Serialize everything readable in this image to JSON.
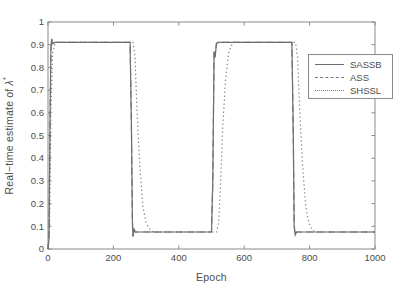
{
  "figure": {
    "xlabel": "Epoch",
    "ylabel_parts": {
      "prefix": "Real−time estimate of ",
      "symbol": "λ",
      "sup": "*"
    }
  },
  "colors": {
    "background": "#ffffff",
    "axis": "#8a8a8a",
    "tick_text": "#4d4d4d",
    "label_text": "#4d4d4d",
    "legend_border": "#8a8a8a"
  },
  "chart_data": {
    "type": "line",
    "title": "",
    "xlabel": "Epoch",
    "ylabel": "Real−time estimate of λ*",
    "xlim": [
      0,
      1000
    ],
    "ylim": [
      0,
      1
    ],
    "xticks": [
      "0",
      "200",
      "400",
      "600",
      "800",
      "1000"
    ],
    "yticks": [
      "0",
      "0.1",
      "0.2",
      "0.3",
      "0.4",
      "0.5",
      "0.6",
      "0.7",
      "0.8",
      "0.9",
      "1"
    ],
    "grid": false,
    "box": true,
    "legend_position": "upper right",
    "series": [
      {
        "name": "SASSB",
        "style": "solid",
        "color": "#6e6e6e",
        "points": [
          [
            0,
            0
          ],
          [
            3,
            0.05
          ],
          [
            6,
            0.55
          ],
          [
            9,
            0.875
          ],
          [
            11,
            0.925
          ],
          [
            14,
            0.905
          ],
          [
            20,
            0.91
          ],
          [
            251,
            0.91
          ],
          [
            255,
            0.55
          ],
          [
            258,
            0.12
          ],
          [
            260,
            0.055
          ],
          [
            263,
            0.09
          ],
          [
            266,
            0.075
          ],
          [
            500,
            0.075
          ],
          [
            504,
            0.3
          ],
          [
            508,
            0.87
          ],
          [
            511,
            0.845
          ],
          [
            515,
            0.905
          ],
          [
            520,
            0.91
          ],
          [
            746,
            0.91
          ],
          [
            750,
            0.5
          ],
          [
            753,
            0.1
          ],
          [
            756,
            0.062
          ],
          [
            760,
            0.075
          ],
          [
            1000,
            0.075
          ]
        ]
      },
      {
        "name": "ASS",
        "style": "dashed",
        "color": "#7a7a7a",
        "points": [
          [
            0,
            0
          ],
          [
            3,
            0.05
          ],
          [
            6,
            0.55
          ],
          [
            9,
            0.875
          ],
          [
            11,
            0.925
          ],
          [
            14,
            0.905
          ],
          [
            20,
            0.91
          ],
          [
            251,
            0.91
          ],
          [
            255,
            0.55
          ],
          [
            258,
            0.12
          ],
          [
            260,
            0.055
          ],
          [
            263,
            0.09
          ],
          [
            266,
            0.075
          ],
          [
            500,
            0.075
          ],
          [
            504,
            0.3
          ],
          [
            508,
            0.87
          ],
          [
            511,
            0.845
          ],
          [
            515,
            0.905
          ],
          [
            520,
            0.91
          ],
          [
            746,
            0.91
          ],
          [
            750,
            0.5
          ],
          [
            753,
            0.1
          ],
          [
            756,
            0.062
          ],
          [
            760,
            0.075
          ],
          [
            1000,
            0.075
          ]
        ]
      },
      {
        "name": "SHSSL",
        "style": "dotted",
        "color": "#7f7f7f",
        "points": [
          [
            0,
            0
          ],
          [
            5,
            0.1
          ],
          [
            9,
            0.6
          ],
          [
            14,
            0.86
          ],
          [
            20,
            0.9
          ],
          [
            24,
            0.91
          ],
          [
            260,
            0.91
          ],
          [
            266,
            0.85
          ],
          [
            272,
            0.62
          ],
          [
            280,
            0.38
          ],
          [
            290,
            0.19
          ],
          [
            300,
            0.115
          ],
          [
            310,
            0.09
          ],
          [
            320,
            0.078
          ],
          [
            330,
            0.075
          ],
          [
            516,
            0.075
          ],
          [
            522,
            0.12
          ],
          [
            528,
            0.3
          ],
          [
            535,
            0.55
          ],
          [
            543,
            0.75
          ],
          [
            552,
            0.86
          ],
          [
            560,
            0.895
          ],
          [
            568,
            0.91
          ],
          [
            757,
            0.91
          ],
          [
            763,
            0.85
          ],
          [
            770,
            0.6
          ],
          [
            778,
            0.38
          ],
          [
            788,
            0.19
          ],
          [
            798,
            0.115
          ],
          [
            808,
            0.085
          ],
          [
            818,
            0.075
          ],
          [
            1000,
            0.075
          ]
        ]
      }
    ]
  }
}
